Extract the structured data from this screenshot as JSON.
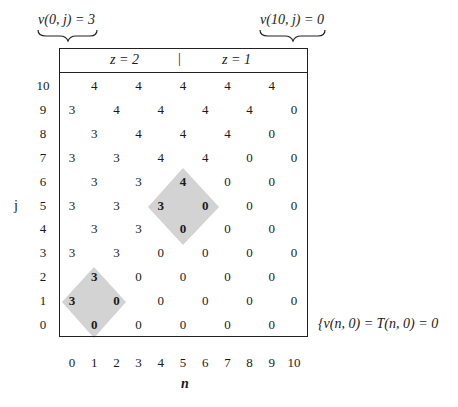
{
  "annotations": {
    "top_left": "v(0, j) = 3",
    "top_right": "v(10, j) = 0",
    "bottom_right": "{v(n, 0) = T(n, 0) = 0"
  },
  "header": {
    "left_label": "z = 2",
    "separator": "|",
    "right_label": "z = 1"
  },
  "axes": {
    "x_label": "n",
    "y_label": "j",
    "x_ticks": [
      "0",
      "1",
      "2",
      "3",
      "4",
      "5",
      "6",
      "7",
      "8",
      "9",
      "10"
    ],
    "y_ticks": [
      "10",
      "9",
      "8",
      "7",
      "6",
      "5",
      "4",
      "3",
      "2",
      "1",
      "0"
    ]
  },
  "highlight_color": "#d3d3d3",
  "grid": {
    "rows": [
      {
        "j": 10,
        "cells": [
          {
            "n": 1,
            "v": "4"
          },
          {
            "n": 3,
            "v": "4"
          },
          {
            "n": 5,
            "v": "4"
          },
          {
            "n": 7,
            "v": "4"
          },
          {
            "n": 9,
            "v": "4"
          }
        ]
      },
      {
        "j": 9,
        "cells": [
          {
            "n": 0,
            "v": "3"
          },
          {
            "n": 2,
            "v": "4"
          },
          {
            "n": 4,
            "v": "4"
          },
          {
            "n": 6,
            "v": "4"
          },
          {
            "n": 8,
            "v": "4"
          },
          {
            "n": 10,
            "v": "0"
          }
        ]
      },
      {
        "j": 8,
        "cells": [
          {
            "n": 1,
            "v": "3"
          },
          {
            "n": 3,
            "v": "4"
          },
          {
            "n": 5,
            "v": "4"
          },
          {
            "n": 7,
            "v": "4"
          },
          {
            "n": 9,
            "v": "0"
          }
        ]
      },
      {
        "j": 7,
        "cells": [
          {
            "n": 0,
            "v": "3"
          },
          {
            "n": 2,
            "v": "3"
          },
          {
            "n": 4,
            "v": "4"
          },
          {
            "n": 6,
            "v": "4"
          },
          {
            "n": 8,
            "v": "0"
          },
          {
            "n": 10,
            "v": "0"
          }
        ]
      },
      {
        "j": 6,
        "cells": [
          {
            "n": 1,
            "v": "3"
          },
          {
            "n": 3,
            "v": "3"
          },
          {
            "n": 5,
            "v": "4",
            "bold": true
          },
          {
            "n": 7,
            "v": "0"
          },
          {
            "n": 9,
            "v": "0"
          }
        ]
      },
      {
        "j": 5,
        "cells": [
          {
            "n": 0,
            "v": "3"
          },
          {
            "n": 2,
            "v": "3"
          },
          {
            "n": 4,
            "v": "3",
            "bold": true
          },
          {
            "n": 6,
            "v": "0",
            "bold": true
          },
          {
            "n": 8,
            "v": "0"
          },
          {
            "n": 10,
            "v": "0"
          }
        ]
      },
      {
        "j": 4,
        "cells": [
          {
            "n": 1,
            "v": "3"
          },
          {
            "n": 3,
            "v": "3"
          },
          {
            "n": 5,
            "v": "0",
            "bold": true
          },
          {
            "n": 7,
            "v": "0"
          },
          {
            "n": 9,
            "v": "0"
          }
        ]
      },
      {
        "j": 3,
        "cells": [
          {
            "n": 0,
            "v": "3"
          },
          {
            "n": 2,
            "v": "3"
          },
          {
            "n": 4,
            "v": "0"
          },
          {
            "n": 6,
            "v": "0"
          },
          {
            "n": 8,
            "v": "0"
          },
          {
            "n": 10,
            "v": "0"
          }
        ]
      },
      {
        "j": 2,
        "cells": [
          {
            "n": 1,
            "v": "3",
            "bold": true
          },
          {
            "n": 3,
            "v": "0"
          },
          {
            "n": 5,
            "v": "0"
          },
          {
            "n": 7,
            "v": "0"
          },
          {
            "n": 9,
            "v": "0"
          }
        ]
      },
      {
        "j": 1,
        "cells": [
          {
            "n": 0,
            "v": "3",
            "bold": true
          },
          {
            "n": 2,
            "v": "0",
            "bold": true
          },
          {
            "n": 4,
            "v": "0"
          },
          {
            "n": 6,
            "v": "0"
          },
          {
            "n": 8,
            "v": "0"
          },
          {
            "n": 10,
            "v": "0"
          }
        ]
      },
      {
        "j": 0,
        "cells": [
          {
            "n": 1,
            "v": "0",
            "bold": true
          },
          {
            "n": 3,
            "v": "0"
          },
          {
            "n": 5,
            "v": "0"
          },
          {
            "n": 7,
            "v": "0"
          },
          {
            "n": 9,
            "v": "0"
          }
        ]
      }
    ]
  },
  "highlights": [
    {
      "center_n": 5,
      "center_j": 5
    },
    {
      "center_n": 1,
      "center_j": 1
    }
  ]
}
